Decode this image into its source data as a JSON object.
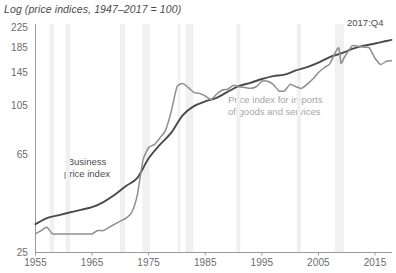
{
  "chart_data": {
    "type": "line",
    "title": "Log (price indices, 1947–2017 = 100)",
    "xlabel": "",
    "ylabel": "",
    "yscale": "log",
    "ylim": [
      25,
      235
    ],
    "xlim": [
      1955,
      2018
    ],
    "grid": false,
    "legend_position": "inline-annotations",
    "yticks": [
      25,
      65,
      105,
      145,
      185,
      225
    ],
    "ytick_labels": [
      "25",
      "65",
      "105",
      "145",
      "185",
      "225"
    ],
    "xticks": [
      1955,
      1965,
      1975,
      1985,
      1995,
      2005,
      2015
    ],
    "xtick_labels": [
      "1955",
      "1965",
      "1975",
      "1985",
      "1995",
      "2005",
      "2015"
    ],
    "annotations": [
      {
        "text": "Business price index",
        "series": "business_price_index",
        "color": "#4b4b4d"
      },
      {
        "text": "Price index for imports of goods and services",
        "series": "import_price_index",
        "color": "#a6a6a6"
      },
      {
        "text": "2017:Q4",
        "color": "#4b4b4d"
      }
    ],
    "recession_bands": [
      {
        "start": 1957.5,
        "end": 1958.3
      },
      {
        "start": 1960.3,
        "end": 1961.1
      },
      {
        "start": 1969.9,
        "end": 1970.8
      },
      {
        "start": 1973.9,
        "end": 1975.2
      },
      {
        "start": 1980.1,
        "end": 1980.6
      },
      {
        "start": 1981.5,
        "end": 1982.9
      },
      {
        "start": 1990.5,
        "end": 1991.2
      },
      {
        "start": 2001.2,
        "end": 2001.9
      },
      {
        "start": 2007.9,
        "end": 2009.5
      }
    ],
    "series": [
      {
        "name": "Business price index",
        "color": "#4a4a4c",
        "x": [
          1955,
          1957,
          1959,
          1961,
          1963,
          1965,
          1967,
          1969,
          1971,
          1973,
          1975,
          1977,
          1979,
          1981,
          1983,
          1985,
          1987,
          1989,
          1991,
          1993,
          1995,
          1997,
          1999,
          2001,
          2003,
          2005,
          2007,
          2009,
          2011,
          2013,
          2015,
          2017,
          2017.9
        ],
        "values": [
          33,
          35,
          36,
          37,
          38,
          39,
          41,
          44,
          48,
          52,
          63,
          72,
          81,
          96,
          105,
          110,
          114,
          121,
          128,
          132,
          137,
          141,
          143,
          149,
          154,
          161,
          170,
          176,
          184,
          190,
          194,
          199,
          201
        ]
      },
      {
        "name": "Price index for imports of goods and services",
        "color": "#8e8e90",
        "x": [
          1955,
          1956,
          1957,
          1958,
          1959,
          1960,
          1961,
          1962,
          1963,
          1964,
          1965,
          1966,
          1967,
          1968,
          1969,
          1970,
          1971,
          1972,
          1973,
          1974,
          1975,
          1976,
          1977,
          1978,
          1979,
          1980,
          1981,
          1982,
          1983,
          1984,
          1985,
          1986,
          1987,
          1988,
          1989,
          1990,
          1991,
          1992,
          1993,
          1994,
          1995,
          1996,
          1997,
          1998,
          1999,
          2000,
          2001,
          2002,
          2003,
          2004,
          2005,
          2006,
          2007,
          2008,
          2008.6,
          2009,
          2009.5,
          2010,
          2011,
          2012,
          2013,
          2014,
          2015,
          2016,
          2017,
          2017.9
        ],
        "values": [
          30,
          31,
          32,
          30,
          30,
          30,
          30,
          30,
          30,
          30,
          30,
          31,
          31,
          32,
          33,
          34,
          35,
          37,
          44,
          62,
          70,
          72,
          77,
          83,
          100,
          127,
          131,
          126,
          120,
          119,
          116,
          112,
          118,
          123,
          124,
          129,
          127,
          126,
          125,
          127,
          134,
          134,
          130,
          122,
          122,
          130,
          127,
          125,
          130,
          137,
          146,
          153,
          159,
          178,
          186,
          160,
          168,
          176,
          190,
          189,
          187,
          186,
          168,
          158,
          163,
          164
        ]
      }
    ]
  },
  "axis": {
    "title": "Log (price indices, 1947–2017 = 100)",
    "end_label": "2017:Q4",
    "ytick_labels": [
      "225",
      "185",
      "145",
      "105",
      "65",
      "25"
    ],
    "xtick_labels": [
      "1955",
      "1965",
      "1975",
      "1985",
      "1995",
      "2005",
      "2015"
    ]
  },
  "annotations": {
    "business_line1": "Business",
    "business_line2": "price index",
    "imports_line1": "Price index for imports",
    "imports_line2": "of goods and services"
  },
  "colors": {
    "business_line": "#4a4a4c",
    "import_line": "#8e8e90",
    "recession_band": "#f0f0f0",
    "axis": "#9a9a9c"
  }
}
